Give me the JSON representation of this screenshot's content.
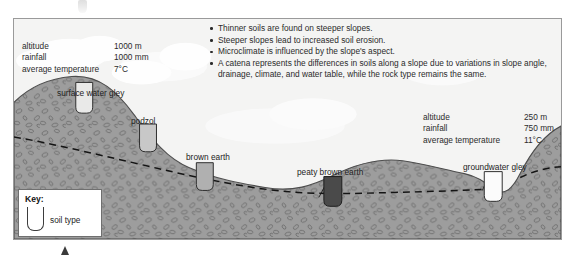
{
  "figure": {
    "title_hidden": "soil catena cross-section",
    "colors": {
      "sky": "#f4f4f3",
      "cloud": "#ffffff",
      "ground": "#9d9d9d",
      "ground_stone": "#6e6e6e",
      "frame_border": "#9a9a9a",
      "pit_light": "#e9e9e8",
      "pit_mid": "#b8b8b8",
      "pit_dark": "#4a4a4a",
      "water_table": "#1a1a1a",
      "text": "#2b2b2b"
    }
  },
  "data_left": {
    "rows": [
      {
        "label": "altitude",
        "value": "1000 m"
      },
      {
        "label": "rainfall",
        "value": "1000 mm"
      },
      {
        "label": "average temperature",
        "value": "7°C"
      }
    ]
  },
  "data_right": {
    "rows": [
      {
        "label": "altitude",
        "value": "250 m"
      },
      {
        "label": "rainfall",
        "value": "750 mm"
      },
      {
        "label": "average temperature",
        "value": "11°C"
      }
    ]
  },
  "bullets": [
    "Thinner soils are found on steeper slopes.",
    "Steeper slopes lead to increased soil erosion.",
    "Microclimate is influenced by the slope's aspect.",
    "A catena represents the differences in soils along a slope due to variations in slope angle, drainage, climate, and water table, while the rock type remains the same."
  ],
  "soil_labels": {
    "surface_water_gley": "surface water gley",
    "podzol": "podzol",
    "brown_earth": "brown earth",
    "peaty_brown_earth": "peaty brown earth",
    "groundwater_gley": "groundwater gley"
  },
  "key": {
    "title": "Key:",
    "swatch_label": "soil type"
  }
}
